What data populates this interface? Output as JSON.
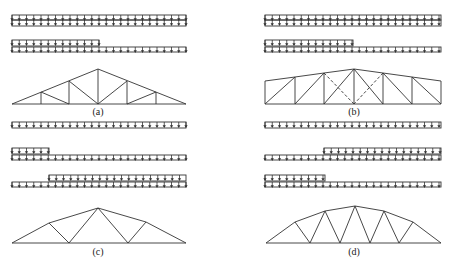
{
  "figure": {
    "panels": [
      {
        "id": "a",
        "label": "(a)",
        "truss_type": "triangular-fink",
        "load_cases": [
          "full-uniform",
          "half-span-left"
        ]
      },
      {
        "id": "b",
        "label": "(b)",
        "truss_type": "trapezoidal-pratt-with-dashed-diagonals",
        "load_cases": [
          "full-uniform",
          "half-span-left"
        ]
      },
      {
        "id": "c",
        "label": "(c)",
        "truss_type": "polygonal-warren",
        "load_cases": [
          "full-uniform",
          "left-fifth",
          "right-four-fifths"
        ]
      },
      {
        "id": "d",
        "label": "(d)",
        "truss_type": "arched-warren",
        "load_cases": [
          "full-uniform",
          "right-half",
          "left-half"
        ]
      }
    ],
    "caption": "",
    "line_color": "#333333",
    "background": "#ffffff"
  }
}
